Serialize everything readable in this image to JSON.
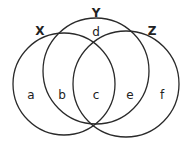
{
  "diagram": {
    "type": "venn-3-set",
    "stroke_color": "#2a2a2a",
    "sets": [
      {
        "label": "X",
        "cx": 64,
        "cy": 84,
        "r": 51
      },
      {
        "label": "Y",
        "cx": 96,
        "cy": 71,
        "r": 53
      },
      {
        "label": "Z",
        "cx": 126,
        "cy": 84,
        "r": 53
      }
    ],
    "regions": [
      {
        "label": "a"
      },
      {
        "label": "b"
      },
      {
        "label": "c"
      },
      {
        "label": "d"
      },
      {
        "label": "e"
      },
      {
        "label": "f"
      }
    ]
  }
}
